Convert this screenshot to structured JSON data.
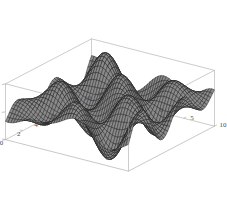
{
  "figure": {
    "name": "surface-plot-3d",
    "background_color": "#ffffff",
    "frame_color": "#9a9a9a",
    "mesh_color": "#1a1a1a",
    "surface_fill": "#6e6e6e",
    "tick_color": "#4a4a4a"
  },
  "chart_data": {
    "type": "surface",
    "title": "",
    "xlabel": "",
    "ylabel": "",
    "zlabel": "",
    "grid": false,
    "legend": "none",
    "projection": "3d-wireframe-mesh",
    "xlim": [
      0,
      10
    ],
    "ylim": [
      -10,
      10
    ],
    "zlim": [
      -1,
      1
    ],
    "x_ticks": [
      0,
      2,
      4,
      6,
      8,
      10
    ],
    "x_tick_labels": [
      "0",
      "2",
      "4",
      "6",
      "8",
      "10"
    ],
    "y_ticks": [
      -10,
      -5,
      0,
      5,
      10
    ],
    "y_tick_labels": [
      "-10",
      "-5",
      "0",
      "5",
      "10"
    ],
    "z_ticks": [
      -1,
      0,
      1
    ],
    "z_tick_labels": [
      "-1",
      "0",
      "1"
    ],
    "function": "sin(x)*cos(y) style oscillatory surface",
    "nx": 46,
    "ny": 46,
    "view_azimuth_deg": -55,
    "view_elevation_deg": 22
  },
  "axes": {
    "x": {
      "name": "x-axis",
      "ticks": [
        {
          "value": 0,
          "label": "0"
        },
        {
          "value": 2,
          "label": "2"
        },
        {
          "value": 4,
          "label": "4"
        },
        {
          "value": 6,
          "label": "6"
        },
        {
          "value": 8,
          "label": "8"
        },
        {
          "value": 10,
          "label": "10"
        }
      ]
    },
    "y": {
      "name": "y-axis",
      "ticks": [
        {
          "value": -10,
          "label": "-10"
        },
        {
          "value": -5,
          "label": "-5"
        },
        {
          "value": 0,
          "label": "0"
        },
        {
          "value": 5,
          "label": "5"
        },
        {
          "value": 10,
          "label": "10"
        }
      ]
    },
    "z": {
      "name": "z-axis",
      "ticks": [
        {
          "value": -1,
          "label": "-1"
        },
        {
          "value": 0,
          "label": "0"
        },
        {
          "value": 1,
          "label": "1"
        }
      ]
    }
  }
}
